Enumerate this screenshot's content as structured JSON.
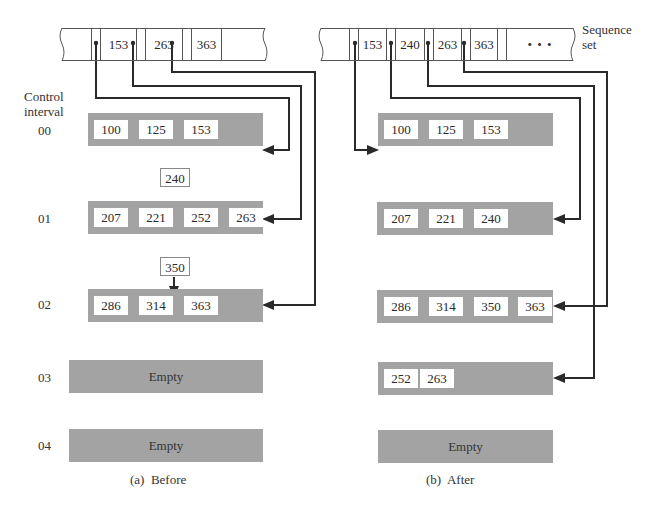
{
  "sequence_set_label": [
    "Sequence",
    "set"
  ],
  "control_interval_label": [
    "Control",
    "interval"
  ],
  "interval_ids": [
    "00",
    "01",
    "02",
    "03",
    "04"
  ],
  "before": {
    "caption": "(a)  Before",
    "index_keys": [
      "153",
      "263",
      "363"
    ],
    "intervals": [
      {
        "id": "00",
        "records": [
          "100",
          "125",
          "153"
        ]
      },
      {
        "id": "01",
        "records": [
          "207",
          "221",
          "252",
          "263"
        ],
        "insert": "240"
      },
      {
        "id": "02",
        "records": [
          "286",
          "314",
          "363"
        ],
        "insert": "350"
      },
      {
        "id": "03",
        "records": [],
        "empty_label": "Empty"
      },
      {
        "id": "04",
        "records": [],
        "empty_label": "Empty"
      }
    ]
  },
  "after": {
    "caption": "(b)  After",
    "index_keys": [
      "153",
      "240",
      "263",
      "363"
    ],
    "ellipsis": "• • •",
    "intervals": [
      {
        "id": "00",
        "records": [
          "100",
          "125",
          "153"
        ]
      },
      {
        "id": "01",
        "records": [
          "207",
          "221",
          "240"
        ]
      },
      {
        "id": "02",
        "records": [
          "286",
          "314",
          "350",
          "363"
        ]
      },
      {
        "id": "03",
        "records": [
          "252",
          "263"
        ]
      },
      {
        "id": "04",
        "records": [],
        "empty_label": "Empty"
      }
    ]
  },
  "colors": {
    "interval_fill": "#a3a3a3",
    "line": "#2a2a2a",
    "record_fill": "#ffffff"
  }
}
